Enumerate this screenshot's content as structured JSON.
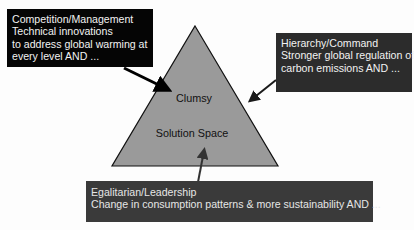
{
  "diagram": {
    "triangle": {
      "labels": {
        "top": "Clumsy",
        "bottom": "Solution Space"
      },
      "fill": "#999999",
      "stroke": "#111111"
    },
    "boxes": {
      "left": {
        "title": "Competition/Management",
        "lines": [
          "Technical innovations",
          "to address global warming at",
          "every level AND ..."
        ],
        "fill": "#050505"
      },
      "right": {
        "title": "Hierarchy/Command",
        "lines": [
          "Stronger global regulation of",
          "carbon emissions AND ..."
        ],
        "fill": "#2c2c2c"
      },
      "bottom": {
        "title": "Egalitarian/Leadership",
        "lines": [
          "Change in consumption patterns & more sustainability AND ..."
        ],
        "fill": "#3a3a3a"
      }
    },
    "arrows": [
      {
        "from": "left-box",
        "to": "triangle",
        "color": "#000000"
      },
      {
        "from": "right-box",
        "to": "triangle",
        "color": "#1a1a1a"
      },
      {
        "from": "bottom-box",
        "to": "triangle",
        "color": "#333333"
      }
    ]
  }
}
